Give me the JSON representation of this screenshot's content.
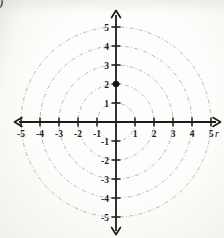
{
  "figure": {
    "corner_mark": ")"
  },
  "chart_data": {
    "type": "scatter",
    "title": "",
    "subtitle": "",
    "xlabel": "r",
    "ylabel": "",
    "xlim": [
      -5.5,
      5.5
    ],
    "ylim": [
      -5.5,
      5.5
    ],
    "grid": "polar-concentric-circles",
    "grid_circle_radii": [
      1,
      2,
      3,
      4,
      5
    ],
    "x_tick_values": [
      -5,
      -4,
      -3,
      -2,
      -1,
      1,
      2,
      3,
      4,
      5
    ],
    "x_tick_labels": [
      "-5",
      "-4",
      "-3",
      "-2",
      "-1",
      "1",
      "2",
      "3",
      "4",
      "5"
    ],
    "y_tick_values": [
      -5,
      -4,
      -3,
      -2,
      -1,
      1,
      2,
      3,
      4,
      5
    ],
    "y_tick_labels": [
      "-5",
      "-4",
      "-3",
      "-2",
      "-1",
      "1",
      "2",
      "3",
      "4",
      "5"
    ],
    "points": [
      {
        "x": 0,
        "y": 2
      }
    ],
    "legend": null,
    "colors": {
      "axis": "#1d1c1a",
      "grid_circle": "#b2b0ab",
      "tick_label": "#22211f",
      "point": "#151513",
      "background": "#faf9f6"
    }
  }
}
